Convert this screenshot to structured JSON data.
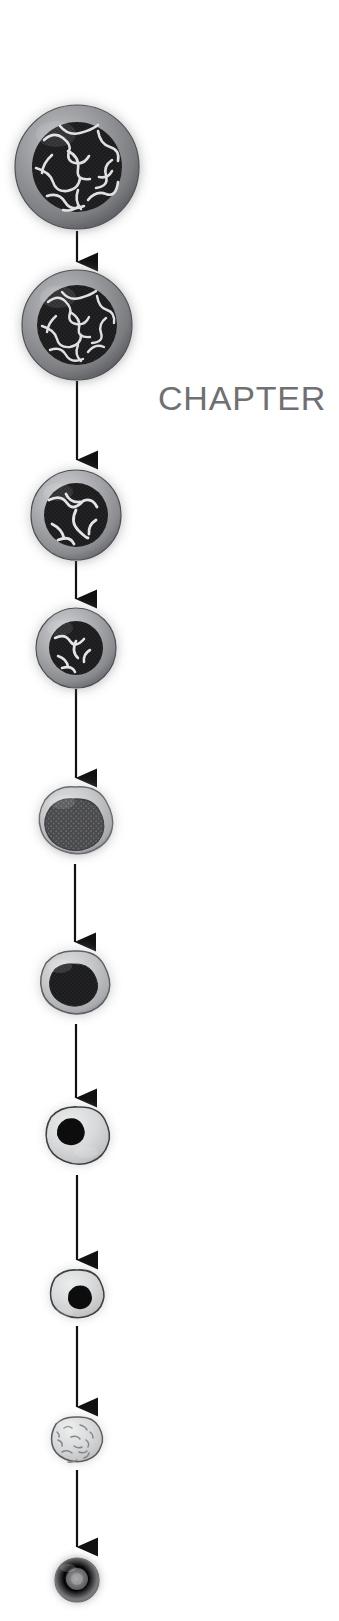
{
  "page": {
    "background_color": "#ffffff",
    "width": 339,
    "height": 1621
  },
  "chapter": {
    "label": "CHAPTER",
    "color": "#6f7073",
    "truncated": true
  },
  "diagram": {
    "name": "red-blood-cell-maturation-flow",
    "orientation": "vertical",
    "connector": {
      "type": "arrow",
      "color": "#111111",
      "line_width": 2.2,
      "head_width": 19,
      "head_height": 22
    },
    "palette": {
      "cytoplasm_outer": "#8f9094",
      "cytoplasm_light": "#c9cacb",
      "cytoplasm_pale": "#d9dadb",
      "nucleus_dark": "#1b1b1d",
      "nucleus_mid": "#4a4b4e",
      "chromatin_strand": "#e8e9ea",
      "outline": "#2b2c2e",
      "erythrocyte": "#8b8c90",
      "glow": "#bcbdc0"
    },
    "cells": [
      {
        "index": 1,
        "name": "proerythroblast",
        "cx": 77,
        "cy": 167,
        "radius": 62,
        "nucleus_radius": 45,
        "shape": "circle",
        "nucleus": "open-chromatin",
        "nucleus_color": "#1b1b1d",
        "cytoplasm_color": "#8f9094"
      },
      {
        "index": 2,
        "name": "basophilic-erythroblast",
        "cx": 77,
        "cy": 325,
        "radius": 55,
        "nucleus_radius": 40,
        "shape": "circle",
        "nucleus": "open-chromatin",
        "nucleus_color": "#1b1b1d",
        "cytoplasm_color": "#8f9094"
      },
      {
        "index": 3,
        "name": "polychromatic-erythroblast",
        "cx": 76,
        "cy": 515,
        "radius": 45,
        "nucleus_radius": 32,
        "shape": "circle",
        "nucleus": "coarse-chromatin",
        "nucleus_color": "#1b1b1d",
        "cytoplasm_color": "#96979b"
      },
      {
        "index": 4,
        "name": "orthochromatic-erythroblast",
        "cx": 76,
        "cy": 648,
        "radius": 40,
        "nucleus_radius": 27,
        "shape": "circle",
        "nucleus": "coarse-chromatin",
        "nucleus_color": "#1b1b1d",
        "cytoplasm_color": "#9b9ca0"
      },
      {
        "index": 5,
        "name": "late-erythroblast-condensing",
        "cx": 75,
        "cy": 825,
        "radius": 38,
        "nucleus_radius": 27,
        "shape": "blob",
        "nucleus": "condensed-stippled",
        "nucleus_color": "#4a4b4e",
        "cytoplasm_color": "#aeafb2"
      },
      {
        "index": 6,
        "name": "late-erythroblast-pyknotic",
        "cx": 75,
        "cy": 987,
        "radius": 36,
        "nucleus_radius": 23,
        "shape": "blob",
        "nucleus": "pyknotic",
        "nucleus_color": "#303133",
        "cytoplasm_color": "#b6b7ba"
      },
      {
        "index": 7,
        "name": "nucleus-extruding-eccentric",
        "cx": 78,
        "cy": 1140,
        "radius": 33,
        "nucleus_radius": 17,
        "shape": "blob",
        "nucleus": "eccentric-dense",
        "nucleus_color": "#111112",
        "cytoplasm_color": "#c5c6c8"
      },
      {
        "index": 8,
        "name": "nucleus-extrusion",
        "cx": 77,
        "cy": 1297,
        "radius": 28,
        "nucleus_radius": 14,
        "shape": "blob",
        "nucleus": "eccentric-dense",
        "nucleus_color": "#111112",
        "cytoplasm_color": "#cdcecf"
      },
      {
        "index": 9,
        "name": "reticulocyte",
        "cx": 77,
        "cy": 1443,
        "radius": 26,
        "nucleus_radius": 0,
        "shape": "blob",
        "nucleus": "none-ribosomal-remnants",
        "nucleus_color": "#8a8b8e",
        "cytoplasm_color": "#d9dadb"
      },
      {
        "index": 10,
        "name": "mature-erythrocyte",
        "cx": 77,
        "cy": 1580,
        "radius": 22,
        "nucleus_radius": 0,
        "shape": "circle",
        "nucleus": "none",
        "nucleus_color": "#8b8c90",
        "cytoplasm_color": "#8b8c90"
      }
    ],
    "arrows": [
      {
        "index": 1,
        "from_cell": 1,
        "to_cell": 2,
        "x": 77,
        "y1": 231,
        "y2": 268
      },
      {
        "index": 2,
        "from_cell": 2,
        "to_cell": 3,
        "x": 77,
        "y1": 381,
        "y2": 466
      },
      {
        "index": 3,
        "from_cell": 3,
        "to_cell": 4,
        "x": 76,
        "y1": 561,
        "y2": 605
      },
      {
        "index": 4,
        "from_cell": 4,
        "to_cell": 5,
        "x": 76,
        "y1": 689,
        "y2": 784
      },
      {
        "index": 5,
        "from_cell": 5,
        "to_cell": 6,
        "x": 75,
        "y1": 864,
        "y2": 948
      },
      {
        "index": 6,
        "from_cell": 6,
        "to_cell": 7,
        "x": 76,
        "y1": 1024,
        "y2": 1104
      },
      {
        "index": 7,
        "from_cell": 7,
        "to_cell": 8,
        "x": 77,
        "y1": 1175,
        "y2": 1266
      },
      {
        "index": 8,
        "from_cell": 8,
        "to_cell": 9,
        "x": 77,
        "y1": 1326,
        "y2": 1413
      },
      {
        "index": 9,
        "from_cell": 9,
        "to_cell": 10,
        "x": 77,
        "y1": 1470,
        "y2": 1553
      }
    ]
  }
}
